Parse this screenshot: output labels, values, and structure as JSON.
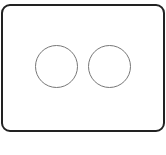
{
  "diagram": {
    "shape": "rounded-rectangle-with-two-circles",
    "frame": {
      "border_color": "#222222",
      "fill_color": "#ffffff"
    },
    "circles": [
      {
        "position": "left",
        "stroke_color": "#777777",
        "fill_color": "#ffffff"
      },
      {
        "position": "right",
        "stroke_color": "#777777",
        "fill_color": "#ffffff"
      }
    ]
  }
}
